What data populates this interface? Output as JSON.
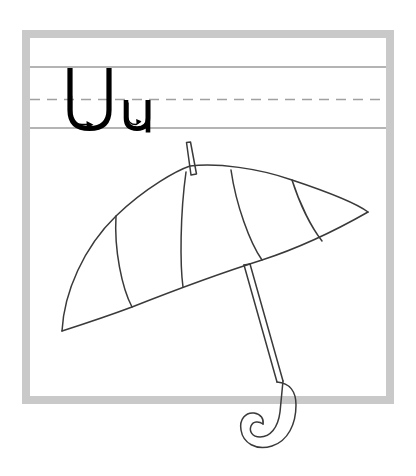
{
  "worksheet": {
    "title": "Letter U u Handwriting Practice",
    "letters": {
      "uppercase": "U",
      "lowercase": "u"
    },
    "picture_label": "umbrella",
    "stroke_arrows": [
      {
        "for": "U",
        "label": "stroke-direction-arrow"
      },
      {
        "for": "u",
        "label": "stroke-direction-arrow"
      }
    ]
  },
  "colors": {
    "background": "#ffffff",
    "frame": "#c8c8c8",
    "guide_line_solid": "#909090",
    "guide_line_dashed": "#9a9a9a",
    "letter_stroke": "#000000",
    "picture_stroke": "#3a3a3a"
  },
  "layout": {
    "frame": {
      "x": 22,
      "y": 30,
      "width": 372,
      "height": 374,
      "border_width": 8
    },
    "guide_lines": {
      "top_solid_y": 67,
      "mid_dashed_y": 99,
      "base_solid_y": 128
    },
    "letter_positions": {
      "uppercase_x": 68,
      "lowercase_x": 124
    }
  },
  "geometry": {
    "canopy": {
      "left_tip": [
        62,
        331
      ],
      "right_tip": [
        368,
        212
      ],
      "apex": [
        186,
        165
      ],
      "rim_left_mid": [
        132,
        306
      ],
      "rim_right_mid": [
        262,
        262
      ]
    },
    "shaft": {
      "top": [
        190,
        142
      ],
      "bottom": [
        272,
        385
      ]
    },
    "handle_hook_center": [
      262,
      417
    ]
  }
}
